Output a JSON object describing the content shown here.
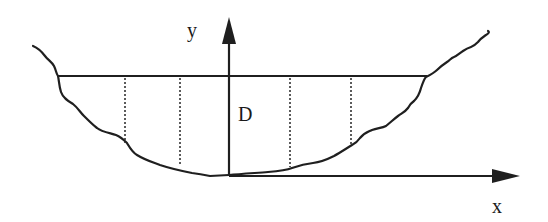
{
  "diagram": {
    "title": "",
    "colors": {
      "stroke": "#1f1f1f",
      "background": "#ffffff"
    },
    "labels": {
      "y_axis": "y",
      "x_axis": "x",
      "depth": "D"
    },
    "elements": [
      {
        "id": "channel-bed",
        "type": "irregular-curve",
        "role": "channel boundary"
      },
      {
        "id": "water-surface",
        "type": "horizontal-line"
      },
      {
        "id": "y-axis",
        "type": "arrow",
        "direction": "up"
      },
      {
        "id": "x-axis",
        "type": "arrow",
        "direction": "right"
      },
      {
        "id": "verticals",
        "type": "dotted-lines",
        "count": 4
      }
    ]
  }
}
